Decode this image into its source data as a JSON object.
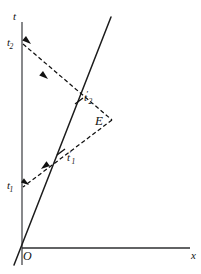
{
  "figure": {
    "type": "minkowski-spacetime-diagram",
    "background_color": "#ffffff",
    "line_color": "#111111",
    "axis_color": "#55565a",
    "width": 201,
    "height": 274
  },
  "axes": {
    "time": {
      "label": "t",
      "orientation": "vertical",
      "x": 22,
      "y_top": 22,
      "y_bottom": 265
    },
    "space": {
      "label": "x",
      "orientation": "horizontal",
      "y": 248,
      "x_left": 22,
      "x_right": 190
    },
    "origin": {
      "label": "O",
      "x": 22,
      "y": 248
    },
    "moving_frame": {
      "label": "",
      "description": "slanted worldline of moving observer",
      "x_top": 111,
      "y_top": 17,
      "x_bottom": 14,
      "y_bottom": 265
    }
  },
  "points": [
    {
      "name": "t2",
      "label_main": "t",
      "label_sub": "2",
      "label_prime": "",
      "x": 22,
      "y": 44,
      "on_axis": "time"
    },
    {
      "name": "t1",
      "label_main": "t",
      "label_sub": "1",
      "label_prime": "",
      "x": 22,
      "y": 187,
      "on_axis": "time"
    },
    {
      "name": "t2-prime",
      "label_main": "t",
      "label_sub": "2",
      "label_prime": "′",
      "x": 79,
      "y": 101,
      "on_axis": "moving_frame"
    },
    {
      "name": "t1-prime",
      "label_main": "t",
      "label_sub": "1",
      "label_prime": "′",
      "x": 61,
      "y": 152,
      "on_axis": "moving_frame"
    },
    {
      "name": "event",
      "label_main": "E",
      "label_sub": "",
      "label_prime": "",
      "x": 112,
      "y": 120,
      "on_axis": ""
    }
  ],
  "rays": [
    {
      "name": "incoming-ray",
      "description": "light signal from event E through t1-prime to t1",
      "style": "dashed",
      "from": [
        112,
        120
      ],
      "to": [
        23,
        187
      ],
      "arrow_points_to": "t1"
    },
    {
      "name": "outgoing-ray",
      "description": "light signal from t2 through t2-prime to event E",
      "style": "dashed",
      "from": [
        23,
        44
      ],
      "to": [
        112,
        120
      ],
      "arrow_points_to": "E"
    }
  ],
  "arrows": [
    {
      "name": "arrow-to-t2",
      "x": 32,
      "y": 45,
      "angle": 215
    },
    {
      "name": "arrow-mid-upper-ray",
      "x": 49,
      "y": 79,
      "angle": 215
    },
    {
      "name": "arrow-mid-lower-ray",
      "x": 39,
      "y": 170,
      "angle": 323
    },
    {
      "name": "arrow-to-t1",
      "x": 30,
      "y": 185,
      "angle": 215
    }
  ]
}
